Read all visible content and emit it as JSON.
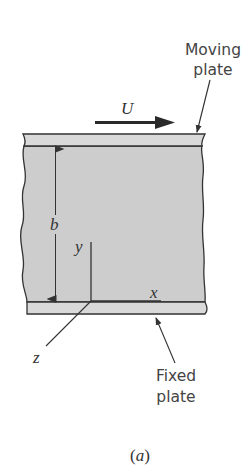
{
  "figure": {
    "caption": {
      "open": "(",
      "letter": "a",
      "close": ")"
    },
    "labels": {
      "moving_plate_line1": "Moving",
      "moving_plate_line2": "plate",
      "fixed_plate_line1": "Fixed",
      "fixed_plate_line2": "plate",
      "velocity": "U",
      "gap": "b",
      "axis_x": "x",
      "axis_y": "y",
      "axis_z": "z"
    },
    "colors": {
      "plate_fill": "#d9d9d9",
      "fluid_fill": "#cdcdcd",
      "outline": "#333333",
      "arrow": "#2a2a2a",
      "text": "#444444"
    }
  }
}
